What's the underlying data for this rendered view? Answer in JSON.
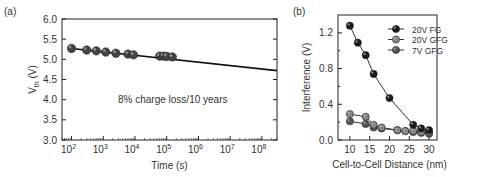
{
  "chart_data": [
    {
      "panel_label": "(a)",
      "type": "scatter",
      "title": "",
      "xlabel": "Time (s)",
      "ylabel": "V_th (V)",
      "ylabel_main": "V",
      "ylabel_sub": "th",
      "ylabel_unit": " (V)",
      "xscale": "log",
      "xlim": [
        50,
        300000000
      ],
      "ylim": [
        3.0,
        6.0
      ],
      "xticks": [
        "10^2",
        "10^3",
        "10^4",
        "10^5",
        "10^6",
        "10^7",
        "10^8"
      ],
      "xtick_exponents": [
        2,
        3,
        4,
        5,
        6,
        7,
        8
      ],
      "yticks": [
        "3.0",
        "3.5",
        "4.0",
        "4.5",
        "5.0",
        "5.5",
        "6.0"
      ],
      "annotation": "8% charge loss/10 years",
      "grid": false,
      "series": [
        {
          "name": "measured",
          "x": [
            100,
            300,
            600,
            1200,
            2500,
            6000,
            9000,
            60000,
            80000,
            100000,
            150000
          ],
          "y": [
            5.27,
            5.23,
            5.21,
            5.18,
            5.15,
            5.13,
            5.11,
            5.08,
            5.08,
            5.07,
            5.06
          ]
        },
        {
          "name": "fit",
          "x": [
            100,
            300000000
          ],
          "y": [
            5.27,
            4.72
          ]
        }
      ]
    },
    {
      "panel_label": "(b)",
      "type": "line",
      "title": "",
      "xlabel": "Cell-to-Cell Distance (nm)",
      "ylabel": "Interference (V)",
      "xlim": [
        7,
        32
      ],
      "ylim": [
        0.0,
        1.4
      ],
      "xticks": [
        "10",
        "15",
        "20",
        "25",
        "30"
      ],
      "yticks": [
        "0.0",
        "0.4",
        "0.8",
        "1.2"
      ],
      "legend_position": "upper right",
      "grid": false,
      "series": [
        {
          "name": "20V FG",
          "color": "#1a1a1a",
          "x": [
            10,
            12,
            14,
            16,
            20,
            26,
            28,
            30
          ],
          "y": [
            1.28,
            1.09,
            0.95,
            0.74,
            0.47,
            0.17,
            0.13,
            0.11
          ]
        },
        {
          "name": "20V GFG",
          "color": "#888888",
          "x": [
            10,
            14,
            16,
            18,
            22,
            24,
            26,
            28,
            30
          ],
          "y": [
            0.29,
            0.26,
            0.17,
            0.14,
            0.11,
            0.1,
            0.1,
            0.09,
            0.09
          ]
        },
        {
          "name": "7V GFG",
          "color": "#555555",
          "x": [
            10,
            14,
            16,
            18,
            22,
            24,
            26,
            28,
            30
          ],
          "y": [
            0.21,
            0.18,
            0.14,
            0.13,
            0.11,
            0.1,
            0.09,
            0.08,
            0.07
          ]
        }
      ]
    }
  ]
}
